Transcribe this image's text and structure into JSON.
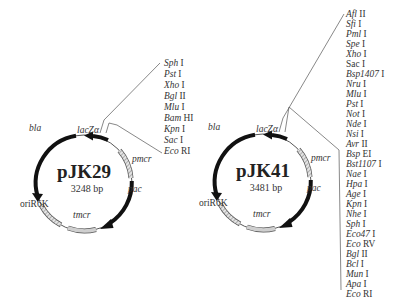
{
  "plasmids": [
    {
      "name": "pJK29",
      "size": "3248 bp",
      "features": {
        "bla": "bla",
        "lacZ": "lacZα",
        "pmcr": "pmcr",
        "pac": "pac",
        "tmcr": "tmcr",
        "ori": "oriR6K"
      },
      "mcs_sites": [
        {
          "enzyme": "Sph",
          "numeral": " I"
        },
        {
          "enzyme": "Pst",
          "numeral": " I"
        },
        {
          "enzyme": "Xho",
          "numeral": " I"
        },
        {
          "enzyme": "Bgl",
          "numeral": " II"
        },
        {
          "enzyme": "Mlu",
          "numeral": " I"
        },
        {
          "enzyme": "Bam",
          "numeral": " HI"
        },
        {
          "enzyme": "Kpn",
          "numeral": " I"
        },
        {
          "enzyme": "Sac",
          "numeral": " I"
        },
        {
          "enzyme": "Eco",
          "numeral": " RI"
        }
      ]
    },
    {
      "name": "pJK41",
      "size": "3481 bp",
      "features": {
        "bla": "bla",
        "lacZ": "lacZα",
        "pmcr": "pmcr",
        "pac": "pac",
        "tmcr": "tmcr",
        "ori": "oriR6K"
      },
      "mcs_sites": [
        {
          "enzyme": "Afl",
          "numeral": " II"
        },
        {
          "enzyme": "Sfi",
          "numeral": " I"
        },
        {
          "enzyme": "Pml",
          "numeral": " I"
        },
        {
          "enzyme": "Spe",
          "numeral": " I"
        },
        {
          "enzyme": "Xho",
          "numeral": " I"
        },
        {
          "enzyme": "Sac",
          "numeral": " I"
        },
        {
          "enzyme": "Bsp1407",
          "numeral": " I"
        },
        {
          "enzyme": "Nru",
          "numeral": " I"
        },
        {
          "enzyme": "Mlu",
          "numeral": " I"
        },
        {
          "enzyme": "Pst",
          "numeral": " I"
        },
        {
          "enzyme": "Not",
          "numeral": " I"
        },
        {
          "enzyme": "Nde",
          "numeral": " I"
        },
        {
          "enzyme": "Nsi",
          "numeral": " I"
        },
        {
          "enzyme": "Avr",
          "numeral": " II"
        },
        {
          "enzyme": "Bsp",
          "numeral": " EI"
        },
        {
          "enzyme": "Bst1107",
          "numeral": " I"
        },
        {
          "enzyme": "Nae",
          "numeral": " I"
        },
        {
          "enzyme": "Hpa",
          "numeral": " I"
        },
        {
          "enzyme": "Age",
          "numeral": " I"
        },
        {
          "enzyme": "Kpn",
          "numeral": " I"
        },
        {
          "enzyme": "Nhe",
          "numeral": " I"
        },
        {
          "enzyme": "Sph",
          "numeral": " I"
        },
        {
          "enzyme": "Eco47",
          "numeral": " I"
        },
        {
          "enzyme": "Eco",
          "numeral": " RV"
        },
        {
          "enzyme": "Bgl",
          "numeral": " II"
        },
        {
          "enzyme": "Bcl",
          "numeral": " I"
        },
        {
          "enzyme": "Mun",
          "numeral": " I"
        },
        {
          "enzyme": "Apa",
          "numeral": " I"
        },
        {
          "enzyme": "Eco",
          "numeral": " RI"
        }
      ]
    }
  ],
  "colors": {
    "ink": "#1a1a1a",
    "thin_line": "#555555",
    "box_fill": "#c8c8c8"
  }
}
